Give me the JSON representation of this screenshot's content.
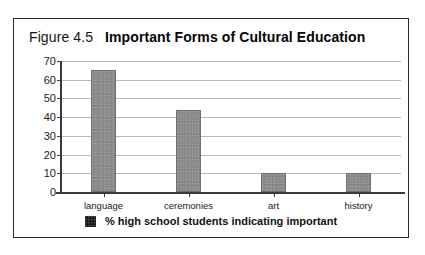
{
  "figure": {
    "number": "Figure 4.5",
    "title": "Important Forms of Cultural Education"
  },
  "colors": {
    "bar_fill": "#8c8c8c",
    "legend_swatch": "#1c1c1c",
    "gridline": "#b9b9b9",
    "axis": "#3a3a3a",
    "frame_border": "#2a2a2a"
  },
  "chart_data": {
    "type": "bar",
    "title": "Important Forms of Cultural Education",
    "categories": [
      "language",
      "ceremonies",
      "art",
      "history"
    ],
    "values": [
      65,
      44,
      10,
      10
    ],
    "series": [
      {
        "name": "% high school students indicating important",
        "values": [
          65,
          44,
          10,
          10
        ]
      }
    ],
    "xlabel": "",
    "ylabel": "",
    "ylim": [
      0,
      70
    ],
    "yticks": [
      0,
      10,
      20,
      30,
      40,
      50,
      60,
      70
    ],
    "ytick_labels": [
      "0",
      "10",
      "20",
      "30",
      "40",
      "50",
      "60",
      "70"
    ],
    "grid": true,
    "legend": {
      "position": "bottom",
      "entries": [
        "% high school students indicating important"
      ]
    }
  }
}
